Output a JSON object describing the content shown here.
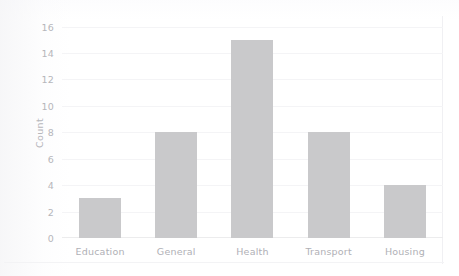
{
  "chart_data": {
    "type": "bar",
    "title": "",
    "xlabel": "",
    "ylabel": "Count",
    "categories": [
      "Education",
      "General",
      "Health",
      "Transport",
      "Housing"
    ],
    "values": [
      3,
      8,
      15,
      8,
      4
    ],
    "ylim": [
      0,
      16.5
    ],
    "yticks": [
      0,
      2,
      4,
      6,
      8,
      10,
      12,
      14,
      16
    ],
    "ytick_labels": [
      "0",
      "2",
      "4",
      "6",
      "8",
      "10",
      "12",
      "14",
      "16"
    ],
    "grid": true,
    "legend": null,
    "bar_color": "#c9c9cb",
    "text_color": "#b4b4b9",
    "background": "#ffffff"
  }
}
